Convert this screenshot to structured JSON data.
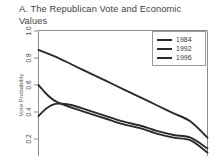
{
  "chart_data": {
    "type": "line",
    "title": "A. The Republican Vote and Economic\nValues",
    "xlabel": "",
    "ylabel": "Vote Probability",
    "ylim": [
      0.05,
      1.0
    ],
    "yticks": [
      1.0,
      0.8,
      0.6,
      0.4,
      0.2
    ],
    "ytick_labels": [
      "1.0",
      "0.8",
      "0.6",
      "0.4",
      "0.2"
    ],
    "xlim": [
      0,
      1
    ],
    "grid": false,
    "legend_position": "top-right",
    "legend_entries": [
      "1984",
      "1992",
      "1996"
    ],
    "series": [
      {
        "name": "1984",
        "color": "#2b2b2b",
        "x": [
          0.0,
          0.1,
          0.2,
          0.3,
          0.4,
          0.5,
          0.6,
          0.7,
          0.8,
          0.9,
          1.0
        ],
        "y": [
          0.86,
          0.81,
          0.75,
          0.69,
          0.63,
          0.57,
          0.51,
          0.45,
          0.39,
          0.33,
          0.21
        ]
      },
      {
        "name": "1992",
        "color": "#2b2b2b",
        "x": [
          0.0,
          0.05,
          0.1,
          0.2,
          0.3,
          0.4,
          0.5,
          0.6,
          0.7,
          0.8,
          0.9,
          1.0
        ],
        "y": [
          0.6,
          0.53,
          0.48,
          0.43,
          0.39,
          0.35,
          0.31,
          0.28,
          0.24,
          0.21,
          0.19,
          0.1
        ]
      },
      {
        "name": "1996",
        "color": "#2b2b2b",
        "x": [
          0.0,
          0.05,
          0.1,
          0.15,
          0.2,
          0.3,
          0.4,
          0.5,
          0.6,
          0.7,
          0.8,
          0.9,
          1.0
        ],
        "y": [
          0.37,
          0.43,
          0.46,
          0.46,
          0.45,
          0.41,
          0.37,
          0.33,
          0.3,
          0.26,
          0.23,
          0.21,
          0.13
        ]
      }
    ]
  },
  "axis": {
    "ylabel": "Vote Probability",
    "ytick_labels": [
      "1.0",
      "0.8",
      "0.6",
      "0.4",
      "0.2"
    ]
  },
  "legend": {
    "items": [
      {
        "label": "1984"
      },
      {
        "label": "1992"
      },
      {
        "label": "1996"
      }
    ]
  }
}
